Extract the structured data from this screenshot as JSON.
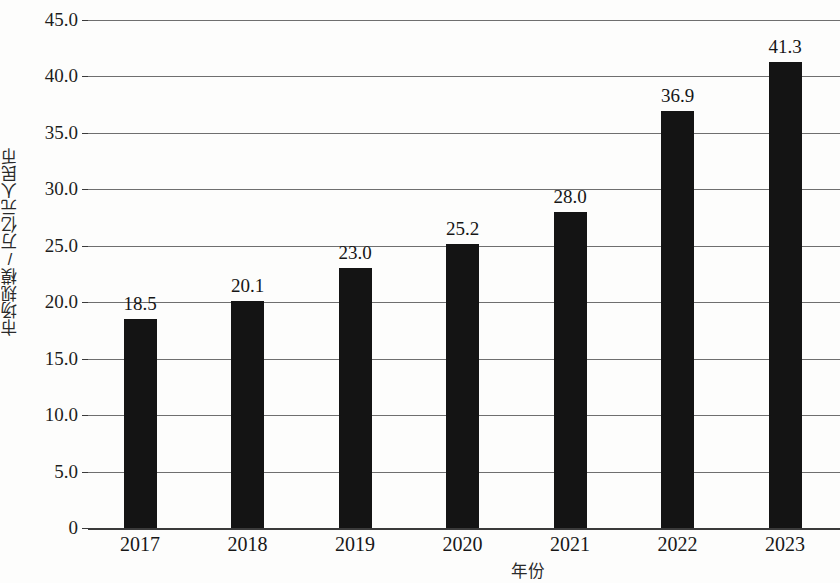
{
  "chart_data": {
    "type": "bar",
    "title": "",
    "xlabel": "年份",
    "ylabel": "市场规模/万亿元人民币",
    "categories": [
      "2017",
      "2018",
      "2019",
      "2020",
      "2021",
      "2022",
      "2023"
    ],
    "values": [
      18.5,
      20.1,
      23.0,
      25.2,
      28.0,
      36.9,
      41.3
    ],
    "value_labels": [
      "18.5",
      "20.1",
      "23.0",
      "25.2",
      "28.0",
      "36.9",
      "41.3"
    ],
    "ylim": [
      0,
      45
    ],
    "ytick_values": [
      0,
      5,
      10,
      15,
      20,
      25,
      30,
      35,
      40,
      45
    ],
    "ytick_labels": [
      "0",
      "5.0",
      "10.0",
      "15.0",
      "20.0",
      "25.0",
      "30.0",
      "35.0",
      "40.0",
      "45.0"
    ],
    "grid": true,
    "grid_orientation": "horizontal",
    "legend": null,
    "legend_position": "none",
    "bar_color": "#141414",
    "gridline_color": "#6f6f6f",
    "axis_color": "#3a3a3a",
    "background_color": "#fdfdfc"
  }
}
